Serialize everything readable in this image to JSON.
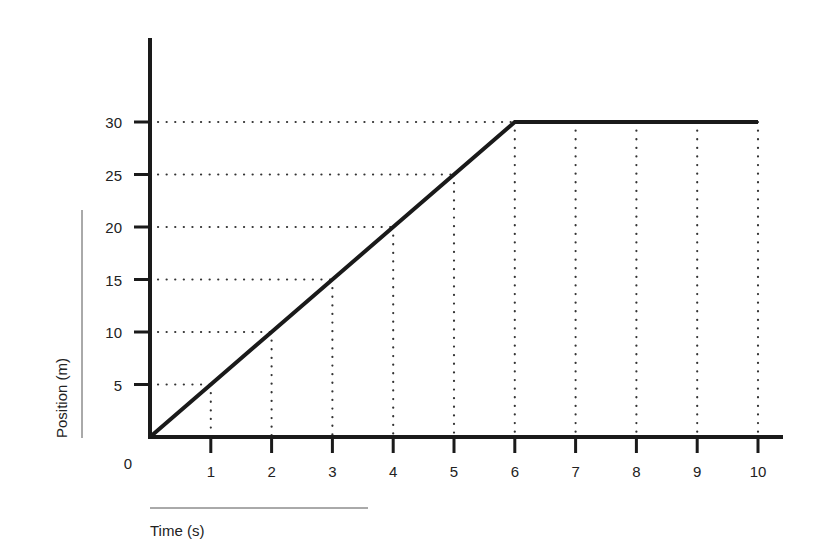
{
  "chart_data": {
    "type": "line",
    "title": "",
    "xlabel": "Time (s)",
    "ylabel": "Position (m)",
    "origin_label": "0",
    "x": [
      0,
      1,
      2,
      3,
      4,
      5,
      6,
      7,
      8,
      9,
      10
    ],
    "series": [
      {
        "name": "Position",
        "values": [
          0,
          5,
          10,
          15,
          20,
          25,
          30,
          30,
          30,
          30,
          30
        ]
      }
    ],
    "x_ticks": [
      "1",
      "2",
      "3",
      "4",
      "5",
      "6",
      "7",
      "8",
      "9",
      "10"
    ],
    "y_ticks": [
      "5",
      "10",
      "15",
      "20",
      "25",
      "30"
    ],
    "xlim": [
      0,
      10
    ],
    "ylim": [
      0,
      30
    ],
    "grid": "dotted guide lines from data points to axes",
    "legend": "none"
  },
  "colors": {
    "line": "#1a1a1a",
    "axis": "#1a1a1a",
    "grid": "#333333",
    "background": "#ffffff"
  }
}
